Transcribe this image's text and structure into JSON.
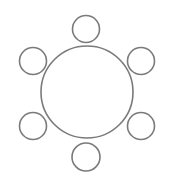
{
  "diagram": {
    "type": "round-table-seating",
    "stroke_color": "#7a7a7a",
    "fill_color": "#ffffff",
    "stroke_width": 1.6,
    "table": {
      "cx": 87,
      "cy": 92,
      "r": 46
    },
    "chairs": [
      {
        "position": "top",
        "cx": 86,
        "cy": 29,
        "r": 13.5
      },
      {
        "position": "top-left",
        "cx": 33,
        "cy": 61,
        "r": 13.5
      },
      {
        "position": "top-right",
        "cx": 141,
        "cy": 61,
        "r": 13.5
      },
      {
        "position": "bottom-left",
        "cx": 33,
        "cy": 126,
        "r": 13.5
      },
      {
        "position": "bottom-right",
        "cx": 141,
        "cy": 126,
        "r": 13.5
      },
      {
        "position": "bottom",
        "cx": 86,
        "cy": 157,
        "r": 14
      }
    ]
  }
}
